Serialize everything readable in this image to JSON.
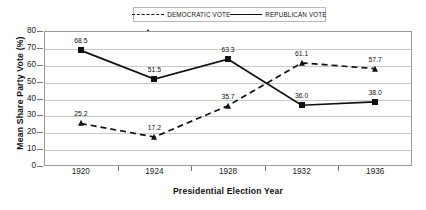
{
  "chart_data": {
    "type": "line",
    "title": "",
    "xlabel": "Presidential Election Year",
    "ylabel": "Mean Share Party Vote (%)",
    "categories": [
      "1920",
      "1924",
      "1928",
      "1932",
      "1936"
    ],
    "x": [
      1920,
      1924,
      1928,
      1932,
      1936
    ],
    "series": [
      {
        "name": "DEMOCRATIC VOTE",
        "values": [
          25.2,
          17.2,
          35.7,
          61.1,
          57.7
        ],
        "labels": [
          "25.2",
          "17.2",
          "35.7",
          "61.1",
          "57.7"
        ],
        "marker": "triangle",
        "line_style": "dashed",
        "color": "#111111"
      },
      {
        "name": "REPUBLICAN VOTE",
        "values": [
          68.5,
          51.5,
          63.3,
          36.0,
          38.0
        ],
        "labels": [
          "68.5",
          "51.5",
          "63.3",
          "36.0",
          "38.0"
        ],
        "marker": "square",
        "line_style": "solid",
        "color": "#111111"
      }
    ],
    "ylim": [
      0,
      80
    ],
    "yticks": [
      "0",
      "10",
      "20",
      "30",
      "40",
      "50",
      "60",
      "70",
      "80"
    ],
    "ytick_values": [
      0,
      10,
      20,
      30,
      40,
      50,
      60,
      70,
      80
    ],
    "grid": true,
    "grid_axis": "y",
    "legend_position": "top-center",
    "legend_border": true,
    "background": "#ffffff",
    "frame_color": "#9a9a9a",
    "gridline_color": "#c9c9c9"
  }
}
